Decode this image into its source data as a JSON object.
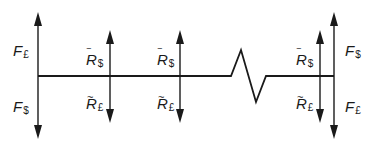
{
  "diagram": {
    "type": "cash-flow diagram with break",
    "line_color": "#1a1a1a",
    "timeline": {
      "y": 76,
      "x_start": 38,
      "x_end": 334,
      "break": {
        "from_x": 231,
        "to_x": 266,
        "peak": [
          241,
          50
        ],
        "valley": [
          256,
          102
        ]
      }
    },
    "arrows": [
      {
        "name": "left-outer",
        "x": 38,
        "top": 13,
        "bottom": 138
      },
      {
        "name": "inner-1",
        "x": 110,
        "top": 31,
        "bottom": 122
      },
      {
        "name": "inner-2",
        "x": 180,
        "top": 31,
        "bottom": 122
      },
      {
        "name": "inner-3",
        "x": 320,
        "top": 31,
        "bottom": 122
      },
      {
        "name": "right-outer",
        "x": 334,
        "top": 13,
        "bottom": 138
      }
    ],
    "labels": {
      "left_top": {
        "base": "F",
        "sub": "£",
        "accent": ""
      },
      "left_bottom": {
        "base": "F",
        "sub": "$",
        "accent": ""
      },
      "i1_top": {
        "base": "R",
        "sub": "$",
        "accent": "‾"
      },
      "i1_bottom": {
        "base": "R",
        "sub": "£",
        "accent": "~"
      },
      "i2_top": {
        "base": "R",
        "sub": "$",
        "accent": "‾"
      },
      "i2_bottom": {
        "base": "R",
        "sub": "£",
        "accent": "~"
      },
      "i3_top": {
        "base": "R",
        "sub": "$",
        "accent": "‾"
      },
      "i3_bottom": {
        "base": "R",
        "sub": "£",
        "accent": "~"
      },
      "right_top": {
        "base": "F",
        "sub": "$",
        "accent": ""
      },
      "right_bottom": {
        "base": "F",
        "sub": "£",
        "accent": ""
      }
    }
  }
}
